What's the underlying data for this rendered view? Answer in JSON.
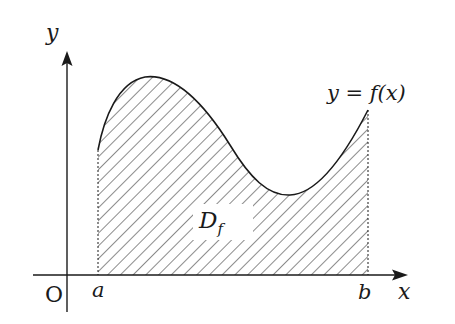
{
  "diagram": {
    "type": "area-under-curve",
    "axes": {
      "y_label": "y",
      "x_label": "x",
      "origin_label": "O"
    },
    "bounds": {
      "lower_label": "a",
      "upper_label": "b"
    },
    "curve": {
      "label": "y = f(x)"
    },
    "region": {
      "label": "D",
      "label_subscript": "f",
      "fill": "hatched"
    },
    "colors": {
      "stroke": "#1a1a1a",
      "background": "#ffffff"
    }
  }
}
